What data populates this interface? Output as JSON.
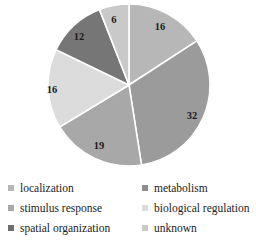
{
  "chart_data": {
    "type": "pie",
    "title": "",
    "subtitle": "",
    "xlabel": "",
    "ylabel": "",
    "legend_position": "bottom",
    "grid": false,
    "start_angle_deg": 0,
    "direction": "clockwise",
    "total": 101,
    "categories": [
      "localization",
      "metabolism",
      "stimulus response",
      "biological regulation",
      "spatial organization",
      "unknown"
    ],
    "values": [
      16,
      32,
      19,
      16,
      12,
      6
    ],
    "data_labels": [
      "16",
      "32",
      "19",
      "16",
      "12",
      "6"
    ],
    "colors": [
      "#b7b7b7",
      "#9b9b9b",
      "#a8a8a8",
      "#dcdcdc",
      "#767676",
      "#c9c9c9"
    ],
    "slices": [
      {
        "label": "localization",
        "value": 16,
        "data_label": "16",
        "color": "#b7b7b7",
        "label_x": 160,
        "label_y": 27
      },
      {
        "label": "metabolism",
        "value": 32,
        "data_label": "32",
        "color": "#9b9b9b",
        "label_x": 192,
        "label_y": 116
      },
      {
        "label": "stimulus response",
        "value": 19,
        "data_label": "19",
        "color": "#a8a8a8",
        "label_x": 99,
        "label_y": 146
      },
      {
        "label": "biological regulation",
        "value": 16,
        "data_label": "16",
        "color": "#dcdcdc",
        "label_x": 52,
        "label_y": 90
      },
      {
        "label": "spatial organization",
        "value": 12,
        "data_label": "12",
        "color": "#767676",
        "label_x": 79,
        "label_y": 37
      },
      {
        "label": "unknown",
        "value": 6,
        "data_label": "6",
        "color": "#c9c9c9",
        "label_x": 114,
        "label_y": 20
      }
    ]
  },
  "legend": {
    "items": [
      {
        "label": "localization",
        "color": "#b7b7b7"
      },
      {
        "label": "metabolism",
        "color": "#8e8e8e"
      },
      {
        "label": "stimulus response",
        "color": "#a8a8a8"
      },
      {
        "label": "biological regulation",
        "color": "#dcdcdc"
      },
      {
        "label": "spatial organization",
        "color": "#6e6e6e"
      },
      {
        "label": "unknown",
        "color": "#c9c9c9"
      }
    ]
  },
  "style": {
    "background": "#ffffff",
    "separator_color": "#ffffff",
    "label_color": "#1a1a1a",
    "legend_text_color": "#1c1c1c"
  }
}
